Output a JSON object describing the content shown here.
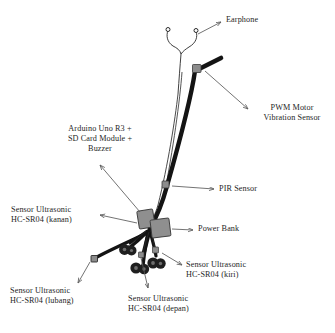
{
  "figure": {
    "background_color": "#ffffff",
    "line_color": "#1a1a1a",
    "leader_color": "#5a5a5a",
    "component_fill": "#8c8c8c",
    "component_stroke": "#3a3a3a",
    "wheel_color": "#1f1f1f"
  },
  "labels": {
    "earphone": "Earphone",
    "pwm_motor": "PWM Motor\nVibration Sensor",
    "arduino": "Arduino Uno R3 +\nSD Card Module +\nBuzzer",
    "pir_sensor": "PIR Sensor",
    "power_bank": "Power Bank",
    "ultrasonic_kanan": "Sensor Ultrasonic\nHC-SR04 (kanan)",
    "ultrasonic_kiri": "Sensor Ultrasonic\nHC-SR04 (kiri)",
    "ultrasonic_lubang": "Sensor Ultrasonic\nHC-SR04 (lubang)",
    "ultrasonic_depan": "Sensor Ultrasonic\nHC-SR04 (depan)"
  },
  "components": [
    {
      "name": "earphone",
      "kind": "y-wire"
    },
    {
      "name": "pwm-motor-vibration-sensor",
      "kind": "box"
    },
    {
      "name": "arduino-uno-r3-sd-card-buzzer",
      "kind": "box"
    },
    {
      "name": "pir-sensor",
      "kind": "small-box"
    },
    {
      "name": "power-bank",
      "kind": "box"
    },
    {
      "name": "ultrasonic-kanan",
      "kind": "wheel"
    },
    {
      "name": "ultrasonic-kiri",
      "kind": "wheel"
    },
    {
      "name": "ultrasonic-depan",
      "kind": "wheel"
    },
    {
      "name": "ultrasonic-lubang",
      "kind": "small-box"
    }
  ]
}
